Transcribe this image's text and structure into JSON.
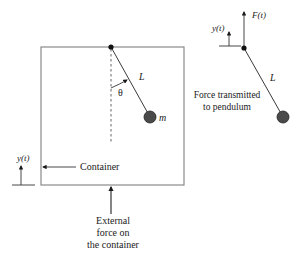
{
  "diagram": {
    "container_box": {
      "x": 41,
      "y": 47,
      "width": 143,
      "height": 138,
      "stroke": "#8a8a8a"
    },
    "left_pendulum": {
      "pivot": {
        "x": 111,
        "y": 47
      },
      "bob": {
        "x": 150,
        "y": 117,
        "r": 6
      },
      "vertical_reference_end_y": 143,
      "length_label": "L",
      "angle_label": "θ",
      "mass_label": "m"
    },
    "right_pendulum": {
      "pivot": {
        "x": 244,
        "y": 48
      },
      "bob": {
        "x": 283,
        "y": 117,
        "r": 6
      },
      "length_label": "L",
      "force_label": "F(t)",
      "displacement_label": "y(t)",
      "caption_line1": "Force transmitted",
      "caption_line2": "to pendulum"
    },
    "left_displacement": {
      "label": "y(t)"
    },
    "container_label": "Container",
    "external_force_caption": {
      "line1": "External",
      "line2": "force on",
      "line3": "the container"
    },
    "colors": {
      "line": "#3a3a3a",
      "box": "#8a8a8a",
      "bob_fill": "#4a4a4a",
      "text": "#1a1a1a"
    }
  }
}
